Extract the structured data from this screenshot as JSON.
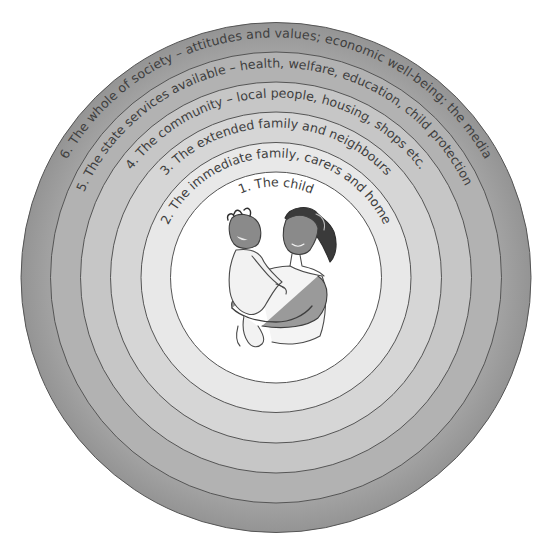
{
  "diagram": {
    "type": "concentric-circles",
    "center_illustration": "mother holding baby",
    "rings": [
      {
        "level": 1,
        "label": "1. The child",
        "color": "#ffffff"
      },
      {
        "level": 2,
        "label": "2. The immediate family, carers and home",
        "color": "#e8e8e8"
      },
      {
        "level": 3,
        "label": "3. The extended family and neighbours",
        "color": "#d6d6d6"
      },
      {
        "level": 4,
        "label": "4. The community – local people, housing, shops etc.",
        "color": "#c6c6c6"
      },
      {
        "level": 5,
        "label": "5. The state services available – health, welfare, education, child protection",
        "color": "#b2b2b2"
      },
      {
        "level": 6,
        "label": "6. The whole of society – attitudes and values; economic well-being; the media",
        "color": "#9c9c9c"
      }
    ],
    "stroke_color": "#555555",
    "text_color": "#3f3f3f"
  }
}
